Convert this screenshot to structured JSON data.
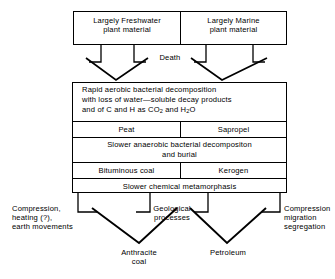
{
  "diagram": {
    "stroke_color": "#000000",
    "background_color": "#ffffff",
    "sources": [
      {
        "id": "freshwater",
        "label": "Largely Freshwater\nplant material"
      },
      {
        "id": "marine",
        "label": "Largely Marine\nplant material"
      }
    ],
    "transitions": {
      "death": "Death"
    },
    "stack": {
      "decomposition": {
        "line1": "Rapid aerobic bacterial decomposition",
        "line2": "with loss of water—soluble decay products",
        "line3_a": "and of C and H as CO",
        "line3_sub1": "2",
        "line3_b": " and H",
        "line3_sub2": "2",
        "line3_c": "O"
      },
      "products_1": {
        "left": "Peat",
        "right": "Sapropel"
      },
      "anaerobic": {
        "line1": "Slower anaerobic bacterial decompositon",
        "line2": "and  burial"
      },
      "products_2": {
        "left": "Bituminous coal",
        "right": "Kerogen"
      },
      "metamorphasis": "Slower chemical  metamorphasis"
    },
    "processes": [
      {
        "id": "compression-heating",
        "label": "Compression,\nheating (?),\nearth movements"
      },
      {
        "id": "geological",
        "label": "Geological\nprocesses"
      },
      {
        "id": "compression-migration",
        "label": "Compression\nmigration\nsegregation"
      }
    ],
    "outputs": [
      {
        "id": "anthracite",
        "label": "Anthracite\ncoal"
      },
      {
        "id": "petroleum",
        "label": "Petroleum"
      }
    ]
  }
}
